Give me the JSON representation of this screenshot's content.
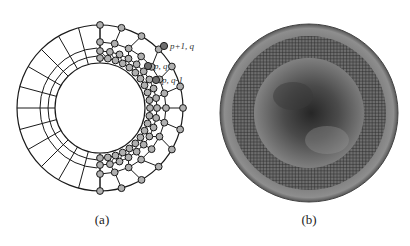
{
  "figure": {
    "panels": [
      {
        "id": "a",
        "caption": "(a)",
        "description": "Annular mesh with polygonal refinement nodes on right half",
        "node_labels": [
          "p+1, q",
          "p, q",
          "p, q-1"
        ],
        "colors": {
          "line": "#1a1a1a",
          "node_fill": "#b0b0b0",
          "node_highlight": "#6e6e6e"
        }
      },
      {
        "id": "b",
        "caption": "(b)",
        "description": "Disc with annular grid mesh band over grayscale shaded field",
        "colors": {
          "outer_ring": "#8a8a8a",
          "mesh_band": "#6a6a6a",
          "center_dark": "#2e2e2e",
          "center_light": "#8c8c8c"
        }
      }
    ]
  }
}
